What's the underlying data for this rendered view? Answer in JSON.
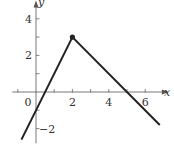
{
  "chart_data": {
    "type": "line",
    "title": "",
    "xlabel": "x",
    "ylabel": "y",
    "xlim": [
      -1.3,
      7.3
    ],
    "ylim": [
      -2.8,
      5
    ],
    "x_ticks": [
      -1,
      0,
      1,
      2,
      3,
      4,
      5,
      6
    ],
    "x_tick_labels": [
      "0",
      "2",
      "4",
      "6"
    ],
    "x_tick_label_values": [
      0,
      2,
      4,
      6
    ],
    "y_ticks": [
      -2,
      -1,
      1,
      2,
      3,
      4
    ],
    "y_tick_labels": [
      "2",
      "4",
      "−2"
    ],
    "y_tick_label_values": [
      2,
      4,
      -2
    ],
    "grid": false,
    "series": [
      {
        "name": "piecewise linear function",
        "x": [
          -0.8,
          2,
          6.8
        ],
        "y": [
          -2.6,
          3,
          -1.8
        ],
        "segments": [
          {
            "equation": "y = 2x - 1",
            "x_range": [
              -0.8,
              2
            ]
          },
          {
            "equation": "y = -x + 5",
            "x_range": [
              2,
              6.8
            ]
          }
        ],
        "marked_point": {
          "x": 2,
          "y": 3,
          "style": "filled-dot"
        }
      }
    ],
    "colors": {
      "line": "#222222",
      "axis": "#555555"
    }
  }
}
